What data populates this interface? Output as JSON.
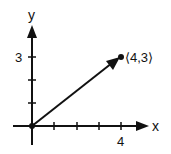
{
  "diagram": {
    "type": "vector-plot",
    "axes": {
      "x_label": "x",
      "y_label": "y",
      "x_tick_label": "4",
      "y_tick_label": "3",
      "x_ticks": [
        1,
        2,
        3,
        4
      ],
      "y_ticks": [
        1,
        2,
        3
      ]
    },
    "vector": {
      "from": [
        0,
        0
      ],
      "to": [
        4,
        3
      ],
      "label": "⟨4,3⟩"
    },
    "colors": {
      "ink": "#111111",
      "background": "#ffffff"
    }
  }
}
